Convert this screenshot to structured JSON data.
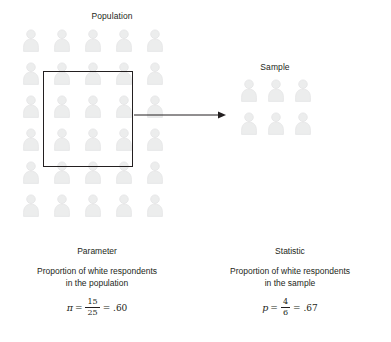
{
  "diagram": {
    "population": {
      "title": "Population",
      "rows": 6,
      "cols": 5,
      "total": 25
    },
    "sample": {
      "title": "Sample",
      "rows": 2,
      "cols": 3,
      "total": 6
    },
    "selection_box": {
      "label": "selection rectangle"
    },
    "arrow": {
      "label": "sampling arrow"
    },
    "parameter": {
      "heading": "Parameter",
      "line1": "Proportion of white respondents",
      "line2": "in the population",
      "symbol": "π",
      "equals": "=",
      "numerator": "15",
      "denominator": "25",
      "result": "= .60"
    },
    "statistic": {
      "heading": "Statistic",
      "line1": "Proportion of white respondents",
      "line2": "in the sample",
      "symbol": "p",
      "equals": "=",
      "numerator": "4",
      "denominator": "6",
      "result": "= .67"
    }
  },
  "colors": {
    "ink": "#231f20",
    "person_fill": "#eceded",
    "person_stroke": "#e2e3e4",
    "background": "#ffffff"
  }
}
